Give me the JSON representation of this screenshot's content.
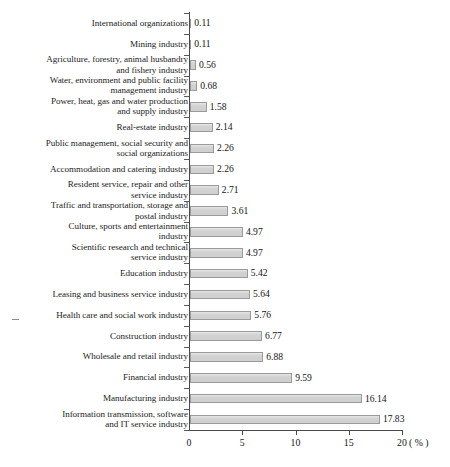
{
  "chart_data": {
    "type": "bar",
    "orientation": "horizontal",
    "title": "",
    "subtitle": "",
    "xlabel": "",
    "ylabel": "",
    "unit_label": "( % )",
    "xlim": [
      0,
      20
    ],
    "xticks": [
      0,
      5,
      10,
      15,
      20
    ],
    "xtick_labels": [
      "0",
      "5",
      "10",
      "15",
      "20"
    ],
    "grid": false,
    "legend": null,
    "categories": [
      "International organizations",
      "Mining industry",
      "Agriculture, forestry, animal husbandry and fishery industry",
      "Water, environment and public facility management industry",
      "Power, heat, gas and water production and supply industry",
      "Real-estate industry",
      "Public management, social security and social organizations",
      "Accommodation and catering industry",
      "Resident service, repair and other service industry",
      "Traffic and transportation, storage and postal industry",
      "Culture, sports and entertainment industry",
      "Scientific research and technical service industry",
      "Education industry",
      "Leasing and business service industry",
      "Health care and social work industry",
      "Construction industry",
      "Wholesale and retail industry",
      "Financial industry",
      "Manufacturing industry",
      "Information transmission, software and IT service industry"
    ],
    "category_lines": [
      [
        "International organizations"
      ],
      [
        "Mining industry"
      ],
      [
        "Agriculture, forestry, animal husbandry",
        "and fishery industry"
      ],
      [
        "Water, environment and public facility",
        "management industry"
      ],
      [
        "Power, heat, gas and water production",
        "and supply industry"
      ],
      [
        "Real-estate industry"
      ],
      [
        "Public management, social security and",
        "social organizations"
      ],
      [
        "Accommodation and catering industry"
      ],
      [
        "Resident service, repair and other",
        "service industry"
      ],
      [
        "Traffic and transportation, storage and",
        "postal industry"
      ],
      [
        "Culture, sports and entertainment",
        "industry"
      ],
      [
        "Scientific research and technical",
        "service industry"
      ],
      [
        "Education industry"
      ],
      [
        "Leasing and business service industry"
      ],
      [
        "Health care and social work industry"
      ],
      [
        "Construction industry"
      ],
      [
        "Wholesale and retail industry"
      ],
      [
        "Financial industry"
      ],
      [
        "Manufacturing industry"
      ],
      [
        "Information transmission, software",
        "and IT service industry"
      ]
    ],
    "values": [
      0.11,
      0.11,
      0.56,
      0.68,
      1.58,
      2.14,
      2.26,
      2.26,
      2.71,
      3.61,
      4.97,
      4.97,
      5.42,
      5.64,
      5.76,
      6.77,
      6.88,
      9.59,
      16.14,
      17.83
    ],
    "value_labels": [
      "0.11",
      "0.11",
      "0.56",
      "0.68",
      "1.58",
      "2.14",
      "2.26",
      "2.26",
      "2.71",
      "3.61",
      "4.97",
      "4.97",
      "5.42",
      "5.64",
      "5.76",
      "6.77",
      "6.88",
      "9.59",
      "16.14",
      "17.83"
    ],
    "bar_fill_color": "#d2d2d2",
    "bar_border_color": "#9a9a9a",
    "axis_color": "#4a4a4a"
  }
}
